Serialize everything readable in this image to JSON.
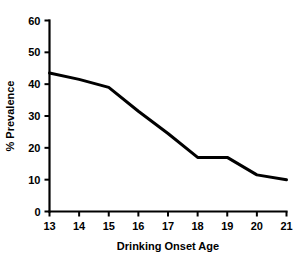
{
  "chart_data": {
    "type": "line",
    "title": "",
    "subtitle": "",
    "xlabel": "Drinking Onset Age",
    "ylabel": "% Prevalence",
    "x": [
      13,
      14,
      15,
      16,
      17,
      18,
      19,
      20,
      21
    ],
    "values": [
      43.5,
      41.5,
      39,
      31.5,
      24.5,
      17,
      17,
      11.5,
      10
    ],
    "series": [
      {
        "name": "Prevalence",
        "values": [
          43.5,
          41.5,
          39,
          31.5,
          24.5,
          17,
          17,
          11.5,
          10
        ]
      }
    ],
    "xlim": [
      13,
      21
    ],
    "ylim": [
      0,
      60
    ],
    "xticks": [
      13,
      14,
      15,
      16,
      17,
      18,
      19,
      20,
      21
    ],
    "yticks": [
      0,
      10,
      20,
      30,
      40,
      50,
      60
    ],
    "xtick_labels": [
      "13",
      "14",
      "15",
      "16",
      "17",
      "18",
      "19",
      "20",
      "21"
    ],
    "ytick_labels": [
      "0",
      "10",
      "20",
      "30",
      "40",
      "50",
      "60"
    ],
    "grid": false,
    "legend": false,
    "legend_position": "none",
    "line_color": "#000000",
    "background_color": "#ffffff",
    "annotations": []
  }
}
